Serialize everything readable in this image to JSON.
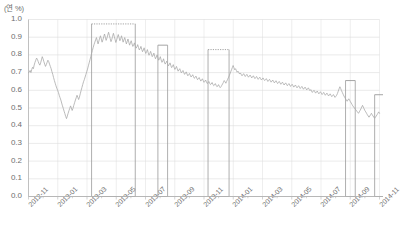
{
  "chart_data": {
    "type": "line",
    "title": "",
    "subtitle": "",
    "unit_label": "(연 %)",
    "xlabel": "",
    "ylabel": "",
    "ylim": [
      0.0,
      1.0
    ],
    "ytick_labels": [
      "1.0",
      "0.9",
      "0.8",
      "0.7",
      "0.6",
      "0.5",
      "0.4",
      "0.3",
      "0.2",
      "0.1",
      "0.0"
    ],
    "ytick_values": [
      1.0,
      0.9,
      0.8,
      0.7,
      0.6,
      0.5,
      0.4,
      0.3,
      0.2,
      0.1,
      0.0
    ],
    "xtick_labels": [
      "2012-11",
      "2013-01",
      "2013-03",
      "2013-05",
      "2013-07",
      "2013-09",
      "2013-11",
      "2014-01",
      "2014-03",
      "2014-05",
      "2014-07",
      "2014-09",
      "2014-11"
    ],
    "grid": true,
    "legend": false,
    "line_color": "#a9a9a9",
    "grid_color": "#dcdcdc",
    "axis_color": "#b4b4b4",
    "highlight_color": "#9a9a9a",
    "series": [
      {
        "name": "rate",
        "values": [
          0.7,
          0.703,
          0.712,
          0.7,
          0.718,
          0.73,
          0.722,
          0.742,
          0.758,
          0.77,
          0.782,
          0.775,
          0.762,
          0.75,
          0.742,
          0.755,
          0.772,
          0.79,
          0.778,
          0.762,
          0.748,
          0.735,
          0.745,
          0.758,
          0.77,
          0.762,
          0.748,
          0.735,
          0.722,
          0.705,
          0.69,
          0.672,
          0.655,
          0.64,
          0.625,
          0.612,
          0.6,
          0.588,
          0.572,
          0.558,
          0.545,
          0.528,
          0.512,
          0.498,
          0.482,
          0.468,
          0.452,
          0.44,
          0.455,
          0.47,
          0.485,
          0.498,
          0.512,
          0.5,
          0.486,
          0.498,
          0.515,
          0.53,
          0.545,
          0.558,
          0.572,
          0.56,
          0.548,
          0.562,
          0.58,
          0.598,
          0.615,
          0.632,
          0.648,
          0.66,
          0.675,
          0.69,
          0.705,
          0.72,
          0.738,
          0.755,
          0.772,
          0.79,
          0.808,
          0.825,
          0.842,
          0.858,
          0.872,
          0.885,
          0.898,
          0.88,
          0.862,
          0.878,
          0.895,
          0.908,
          0.89,
          0.872,
          0.885,
          0.902,
          0.918,
          0.9,
          0.882,
          0.895,
          0.912,
          0.928,
          0.91,
          0.892,
          0.875,
          0.888,
          0.905,
          0.922,
          0.905,
          0.888,
          0.87,
          0.885,
          0.9,
          0.915,
          0.898,
          0.88,
          0.892,
          0.908,
          0.89,
          0.872,
          0.885,
          0.898,
          0.88,
          0.862,
          0.875,
          0.89,
          0.872,
          0.855,
          0.868,
          0.88,
          0.862,
          0.848,
          0.855,
          0.868,
          0.85,
          0.838,
          0.845,
          0.858,
          0.842,
          0.828,
          0.835,
          0.848,
          0.832,
          0.818,
          0.828,
          0.84,
          0.822,
          0.808,
          0.818,
          0.83,
          0.812,
          0.798,
          0.808,
          0.82,
          0.805,
          0.79,
          0.798,
          0.81,
          0.792,
          0.778,
          0.788,
          0.8,
          0.785,
          0.77,
          0.778,
          0.79,
          0.772,
          0.758,
          0.765,
          0.778,
          0.76,
          0.748,
          0.755,
          0.765,
          0.75,
          0.738,
          0.745,
          0.755,
          0.74,
          0.728,
          0.735,
          0.745,
          0.73,
          0.718,
          0.725,
          0.735,
          0.72,
          0.708,
          0.715,
          0.722,
          0.71,
          0.698,
          0.705,
          0.712,
          0.7,
          0.69,
          0.696,
          0.704,
          0.692,
          0.682,
          0.688,
          0.695,
          0.685,
          0.675,
          0.68,
          0.688,
          0.678,
          0.668,
          0.672,
          0.68,
          0.67,
          0.66,
          0.665,
          0.672,
          0.662,
          0.652,
          0.658,
          0.665,
          0.655,
          0.645,
          0.65,
          0.658,
          0.648,
          0.638,
          0.642,
          0.65,
          0.64,
          0.632,
          0.636,
          0.644,
          0.634,
          0.626,
          0.63,
          0.638,
          0.628,
          0.62,
          0.624,
          0.632,
          0.622,
          0.615,
          0.62,
          0.628,
          0.636,
          0.645,
          0.655,
          0.648,
          0.64,
          0.65,
          0.66,
          0.67,
          0.68,
          0.692,
          0.704,
          0.716,
          0.728,
          0.74,
          0.728,
          0.716,
          0.722,
          0.712,
          0.702,
          0.708,
          0.7,
          0.692,
          0.698,
          0.69,
          0.682,
          0.688,
          0.694,
          0.686,
          0.678,
          0.684,
          0.69,
          0.682,
          0.674,
          0.68,
          0.686,
          0.678,
          0.67,
          0.676,
          0.682,
          0.674,
          0.666,
          0.672,
          0.678,
          0.67,
          0.662,
          0.668,
          0.674,
          0.666,
          0.658,
          0.664,
          0.67,
          0.662,
          0.655,
          0.66,
          0.666,
          0.658,
          0.65,
          0.656,
          0.662,
          0.654,
          0.646,
          0.652,
          0.658,
          0.65,
          0.642,
          0.648,
          0.654,
          0.646,
          0.638,
          0.644,
          0.65,
          0.642,
          0.634,
          0.64,
          0.646,
          0.638,
          0.63,
          0.636,
          0.642,
          0.634,
          0.626,
          0.632,
          0.638,
          0.63,
          0.622,
          0.628,
          0.634,
          0.626,
          0.618,
          0.624,
          0.63,
          0.622,
          0.614,
          0.62,
          0.626,
          0.618,
          0.61,
          0.616,
          0.622,
          0.614,
          0.606,
          0.612,
          0.618,
          0.61,
          0.602,
          0.608,
          0.614,
          0.606,
          0.598,
          0.604,
          0.596,
          0.588,
          0.594,
          0.6,
          0.592,
          0.584,
          0.59,
          0.596,
          0.588,
          0.58,
          0.586,
          0.592,
          0.584,
          0.576,
          0.582,
          0.588,
          0.58,
          0.572,
          0.578,
          0.584,
          0.576,
          0.568,
          0.574,
          0.58,
          0.572,
          0.564,
          0.57,
          0.576,
          0.568,
          0.56,
          0.566,
          0.572,
          0.582,
          0.595,
          0.608,
          0.62,
          0.61,
          0.598,
          0.588,
          0.578,
          0.568,
          0.56,
          0.552,
          0.545,
          0.538,
          0.545,
          0.552,
          0.544,
          0.536,
          0.528,
          0.52,
          0.512,
          0.506,
          0.5,
          0.494,
          0.488,
          0.482,
          0.476,
          0.47,
          0.478,
          0.486,
          0.495,
          0.505,
          0.515,
          0.505,
          0.495,
          0.485,
          0.478,
          0.47,
          0.462,
          0.455,
          0.448,
          0.455,
          0.462,
          0.47,
          0.462,
          0.455,
          0.448,
          0.442,
          0.448,
          0.455,
          0.462,
          0.47,
          0.478,
          0.47
        ]
      }
    ],
    "highlight_boxes": [
      {
        "name": "box-1",
        "x_start_index": 78,
        "x_end_index": 132,
        "top_value": 0.975,
        "bottom_value": 0.0,
        "top_style": "dotted"
      },
      {
        "name": "box-2",
        "x_start_index": 160,
        "x_end_index": 172,
        "top_value": 0.855,
        "bottom_value": 0.0,
        "top_style": "solid"
      },
      {
        "name": "box-3",
        "x_start_index": 222,
        "x_end_index": 248,
        "top_value": 0.83,
        "bottom_value": 0.0,
        "top_style": "dotted"
      },
      {
        "name": "box-4",
        "x_start_index": 392,
        "x_end_index": 404,
        "top_value": 0.655,
        "bottom_value": 0.0,
        "top_style": "solid"
      },
      {
        "name": "box-5",
        "x_start_index": 428,
        "x_end_index": 440,
        "top_value": 0.575,
        "bottom_value": 0.0,
        "top_style": "solid"
      }
    ]
  }
}
